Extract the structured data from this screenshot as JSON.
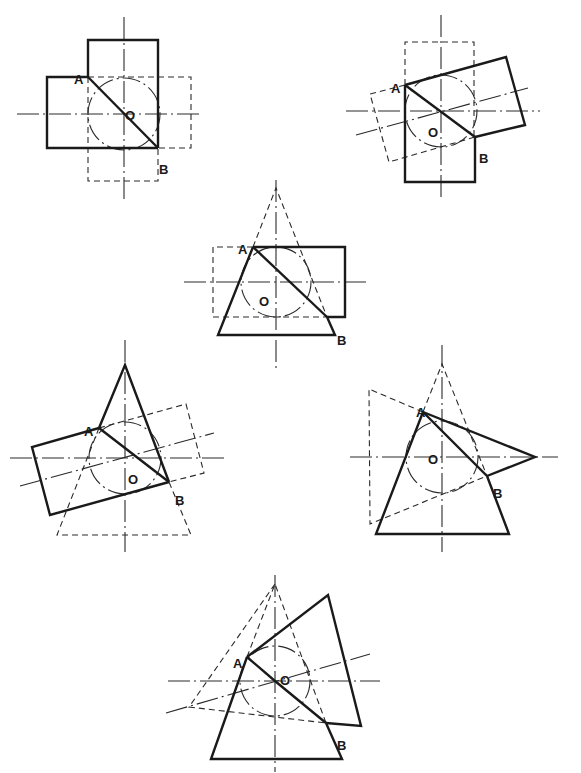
{
  "figure": {
    "width": 581,
    "height": 773,
    "background": "#ffffff",
    "diagrams": [
      {
        "id": "fig-1",
        "center": [
          124,
          114
        ],
        "circle_r": 36,
        "axes": [
          [
            [
              124,
              17
            ],
            [
              124,
              200
            ]
          ],
          [
            [
              17,
              114
            ],
            [
              200,
              114
            ]
          ]
        ],
        "thick": [
          [
            [
              88,
              77
            ],
            [
              88,
              40
            ],
            [
              158,
              40
            ],
            [
              158,
              148
            ]
          ],
          [
            [
              88,
              77
            ],
            [
              47,
              77
            ],
            [
              47,
              148
            ],
            [
              158,
              148
            ]
          ],
          [
            [
              88,
              77
            ],
            [
              158,
              148
            ]
          ]
        ],
        "dashed": [
          [
            [
              88,
              77
            ],
            [
              191,
              77
            ],
            [
              191,
              148
            ],
            [
              158,
              148
            ]
          ],
          [
            [
              88,
              77
            ],
            [
              88,
              181
            ],
            [
              158,
              181
            ],
            [
              158,
              148
            ]
          ]
        ],
        "labels": [
          {
            "text": "A",
            "x": 74,
            "y": 74
          },
          {
            "text": "O",
            "x": 125,
            "y": 110
          },
          {
            "text": "B",
            "x": 159,
            "y": 164
          }
        ]
      },
      {
        "id": "fig-2",
        "center": [
          441,
          111
        ],
        "circle_r": 36,
        "axes": [
          [
            [
              441,
              15
            ],
            [
              441,
              200
            ]
          ],
          [
            [
              346,
              111
            ],
            [
              540,
              111
            ]
          ],
          [
            [
              356,
              135
            ],
            [
              528,
              88
            ]
          ]
        ],
        "thick": [
          [
            [
              405,
              85
            ],
            [
              506,
              57
            ],
            [
              525,
              125
            ],
            [
              475,
              137
            ]
          ],
          [
            [
              405,
              85
            ],
            [
              405,
              182
            ],
            [
              475,
              182
            ],
            [
              475,
              137
            ]
          ],
          [
            [
              405,
              85
            ],
            [
              475,
              137
            ]
          ]
        ],
        "dashed": [
          [
            [
              405,
              85
            ],
            [
              405,
              42
            ],
            [
              474,
              42
            ],
            [
              474,
              137
            ]
          ],
          [
            [
              405,
              85
            ],
            [
              370,
              94
            ],
            [
              389,
              162
            ],
            [
              475,
              137
            ]
          ]
        ],
        "labels": [
          {
            "text": "A",
            "x": 391,
            "y": 83
          },
          {
            "text": "O",
            "x": 428,
            "y": 127
          },
          {
            "text": "B",
            "x": 479,
            "y": 153
          }
        ]
      },
      {
        "id": "fig-3",
        "center": [
          276,
          282
        ],
        "circle_r": 35,
        "axes": [
          [
            [
              276,
              180
            ],
            [
              276,
              372
            ]
          ],
          [
            [
              184,
              282
            ],
            [
              366,
              282
            ]
          ]
        ],
        "thick": [
          [
            [
              253,
              247
            ],
            [
              345,
              247
            ],
            [
              345,
              317
            ],
            [
              327,
              317
            ]
          ],
          [
            [
              253,
              247
            ],
            [
              218,
              335
            ],
            [
              335,
              335
            ],
            [
              327,
              317
            ]
          ],
          [
            [
              253,
              247
            ],
            [
              327,
              317
            ]
          ]
        ],
        "dashed": [
          [
            [
              253,
              247
            ],
            [
              213,
              247
            ],
            [
              213,
              317
            ],
            [
              327,
              317
            ]
          ],
          [
            [
              253,
              247
            ],
            [
              276,
              188
            ],
            [
              327,
              317
            ]
          ]
        ],
        "labels": [
          {
            "text": "A",
            "x": 238,
            "y": 244
          },
          {
            "text": "O",
            "x": 259,
            "y": 296
          },
          {
            "text": "B",
            "x": 337,
            "y": 335
          }
        ]
      },
      {
        "id": "fig-4",
        "center": [
          125,
          458
        ],
        "circle_r": 36,
        "axes": [
          [
            [
              125,
              340
            ],
            [
              125,
              552
            ]
          ],
          [
            [
              10,
              458
            ],
            [
              228,
              458
            ]
          ],
          [
            [
              20,
              486
            ],
            [
              214,
              433
            ]
          ]
        ],
        "thick": [
          [
            [
              99,
              428
            ],
            [
              125,
              365
            ],
            [
              169,
              482
            ]
          ],
          [
            [
              99,
              428
            ],
            [
              32,
              447
            ],
            [
              50,
              515
            ],
            [
              169,
              482
            ]
          ],
          [
            [
              99,
              428
            ],
            [
              169,
              482
            ]
          ]
        ],
        "dashed": [
          [
            [
              99,
              428
            ],
            [
              186,
              404
            ],
            [
              204,
              473
            ],
            [
              169,
              482
            ]
          ],
          [
            [
              99,
              428
            ],
            [
              57,
              535
            ],
            [
              191,
              535
            ],
            [
              169,
              482
            ]
          ]
        ],
        "labels": [
          {
            "text": "A",
            "x": 84,
            "y": 426
          },
          {
            "text": "O",
            "x": 128,
            "y": 474
          },
          {
            "text": "B",
            "x": 175,
            "y": 495
          }
        ]
      },
      {
        "id": "fig-5",
        "center": [
          442,
          457
        ],
        "circle_r": 36,
        "axes": [
          [
            [
              442,
              345
            ],
            [
              442,
              552
            ]
          ],
          [
            [
              350,
              457
            ],
            [
              558,
              457
            ]
          ]
        ],
        "thick": [
          [
            [
              423,
              412
            ],
            [
              535,
              457
            ],
            [
              487,
              476
            ]
          ],
          [
            [
              423,
              412
            ],
            [
              376,
              534
            ],
            [
              509,
              534
            ],
            [
              487,
              476
            ]
          ],
          [
            [
              423,
              412
            ],
            [
              487,
              476
            ]
          ]
        ],
        "dashed": [
          [
            [
              423,
              412
            ],
            [
              369,
              389
            ],
            [
              370,
              524
            ],
            [
              487,
              476
            ]
          ],
          [
            [
              423,
              412
            ],
            [
              442,
              364
            ],
            [
              487,
              476
            ]
          ]
        ],
        "labels": [
          {
            "text": "A",
            "x": 416,
            "y": 407
          },
          {
            "text": "O",
            "x": 428,
            "y": 454
          },
          {
            "text": "B",
            "x": 493,
            "y": 488
          }
        ]
      },
      {
        "id": "fig-6",
        "center": [
          275,
          681
        ],
        "circle_r": 35,
        "axes": [
          [
            [
              275,
              575
            ],
            [
              275,
              772
            ]
          ],
          [
            [
              168,
              681
            ],
            [
              380,
              681
            ]
          ],
          [
            [
              166,
              713
            ],
            [
              370,
              654
            ]
          ]
        ],
        "thick": [
          [
            [
              247,
              657
            ],
            [
              328,
              595
            ],
            [
              361,
              726
            ],
            [
              326,
              723
            ]
          ],
          [
            [
              247,
              657
            ],
            [
              211,
              759
            ],
            [
              342,
              759
            ],
            [
              326,
              723
            ]
          ],
          [
            [
              247,
              657
            ],
            [
              275,
              681
            ],
            [
              326,
              723
            ]
          ]
        ],
        "dashed": [
          [
            [
              247,
              657
            ],
            [
              275,
              584
            ],
            [
              326,
              723
            ]
          ],
          [
            [
              275,
              584
            ],
            [
              189,
              707
            ],
            [
              326,
              723
            ]
          ]
        ],
        "labels": [
          {
            "text": "A",
            "x": 233,
            "y": 658
          },
          {
            "text": "O",
            "x": 280,
            "y": 675
          },
          {
            "text": "B",
            "x": 337,
            "y": 740
          }
        ]
      }
    ]
  }
}
